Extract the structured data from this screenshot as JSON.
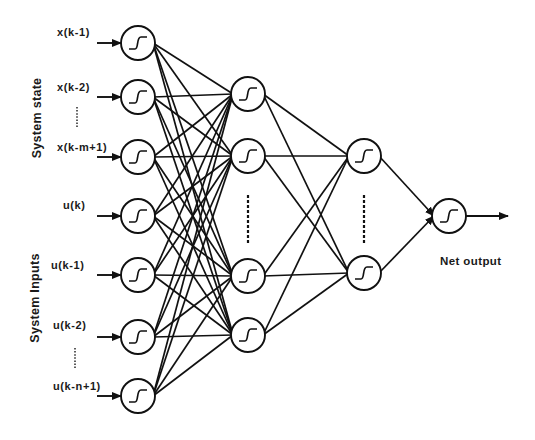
{
  "diagram": {
    "type": "feedforward-neural-network",
    "groups": {
      "system_state": "System state",
      "system_inputs": "System Inputs"
    },
    "inputs": [
      {
        "label": "x(k-1)",
        "group": "system_state"
      },
      {
        "label": "x(k-2)",
        "group": "system_state"
      },
      {
        "label": "x(k-m+1)",
        "group": "system_state"
      },
      {
        "label": "u(k)",
        "group": "system_inputs"
      },
      {
        "label": "u(k-1)",
        "group": "system_inputs"
      },
      {
        "label": "u(k-2)",
        "group": "system_inputs"
      },
      {
        "label": "u(k-n+1)",
        "group": "system_inputs"
      }
    ],
    "ellipsis_markers": [
      "between x(k-2) and x(k-m+1)",
      "between u(k-2) and u(k-n+1)"
    ],
    "layers": [
      {
        "name": "input-layer",
        "nodes": 7,
        "activation": "sigmoid"
      },
      {
        "name": "hidden-layer-1",
        "nodes": 4,
        "activation": "sigmoid",
        "truncated": true
      },
      {
        "name": "hidden-layer-2",
        "nodes": 2,
        "activation": "sigmoid",
        "truncated": true
      },
      {
        "name": "output-layer",
        "nodes": 1,
        "activation": "sigmoid"
      }
    ],
    "connectivity": "fully-connected",
    "output_label": "Net output"
  }
}
